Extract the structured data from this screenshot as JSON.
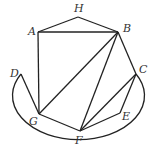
{
  "diagram": {
    "type": "geometry",
    "stroke_color": "#222222",
    "points": [
      {
        "name": "A",
        "x": 38,
        "y": 32,
        "label_x": 28,
        "label_y": 35
      },
      {
        "name": "H",
        "x": 78,
        "y": 17,
        "label_x": 74,
        "label_y": 12
      },
      {
        "name": "B",
        "x": 118,
        "y": 32,
        "label_x": 123,
        "label_y": 32
      },
      {
        "name": "C",
        "x": 136,
        "y": 74,
        "label_x": 139,
        "label_y": 73
      },
      {
        "name": "D",
        "x": 21,
        "y": 74,
        "label_x": 10,
        "label_y": 77
      },
      {
        "name": "G",
        "x": 39,
        "y": 114,
        "label_x": 29,
        "label_y": 125
      },
      {
        "name": "F",
        "x": 80,
        "y": 131,
        "label_x": 75,
        "label_y": 144
      },
      {
        "name": "E",
        "x": 120,
        "y": 113,
        "label_x": 122,
        "label_y": 120
      }
    ],
    "segments": [
      [
        "A",
        "H"
      ],
      [
        "H",
        "B"
      ],
      [
        "A",
        "B"
      ],
      [
        "A",
        "G"
      ],
      [
        "D",
        "G"
      ],
      [
        "B",
        "G"
      ],
      [
        "B",
        "F"
      ],
      [
        "B",
        "C"
      ],
      [
        "C",
        "F"
      ],
      [
        "C",
        "E"
      ],
      [
        "E",
        "F"
      ],
      [
        "G",
        "F"
      ]
    ],
    "arc": {
      "from": "D",
      "to": "C",
      "through": "bottom",
      "cx": 79,
      "cy": 104,
      "rx": 66,
      "ry": 44
    }
  }
}
